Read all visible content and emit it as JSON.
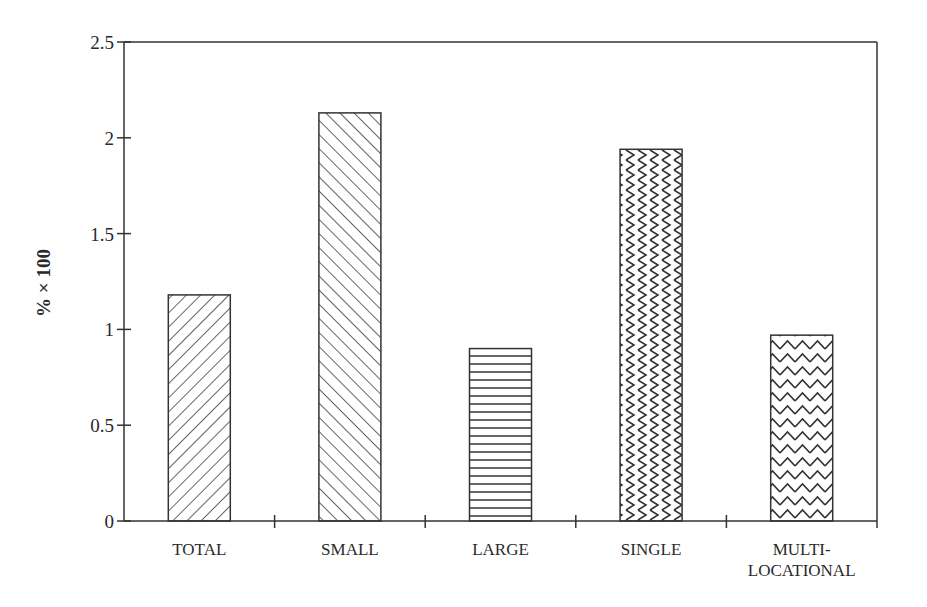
{
  "chart_data": {
    "type": "bar",
    "title": "",
    "xlabel": "",
    "ylabel": "% × 100",
    "ylim": [
      0,
      2.5
    ],
    "yticks": [
      0,
      0.5,
      1,
      1.5,
      2,
      2.5
    ],
    "ytick_labels": [
      "0",
      "0.5",
      "1",
      "1.5",
      "2",
      "2.5"
    ],
    "grid": false,
    "legend": "none",
    "categories": [
      "TOTAL",
      "SMALL",
      "LARGE",
      "SINGLE",
      "MULTI-LOCATIONAL"
    ],
    "category_label_lines": [
      [
        "TOTAL"
      ],
      [
        "SMALL"
      ],
      [
        "LARGE"
      ],
      [
        "SINGLE"
      ],
      [
        "MULTI-",
        "LOCATIONAL"
      ]
    ],
    "values": [
      1.18,
      2.13,
      0.9,
      1.94,
      0.97
    ],
    "fill_patterns": [
      "diagonal-forward",
      "diagonal-backward",
      "horizontal-lines",
      "vertical-zigzag",
      "horizontal-zigzag"
    ],
    "colors": {
      "ink": "#333333",
      "background": "#ffffff"
    }
  }
}
